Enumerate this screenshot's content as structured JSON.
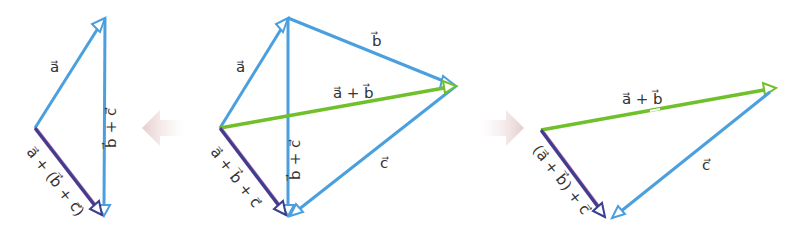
{
  "colors": {
    "vector_blue": "#4a9fdf",
    "vector_green": "#6fc02a",
    "resultant_dark": "#3a3f8f",
    "resultant_edge": "#d07ab8",
    "label": "#333333",
    "fade_arrow": "#e8d6d6"
  },
  "panels": [
    {
      "id": "left",
      "description": "a + (b + c)",
      "labels": {
        "a": "a⃗",
        "b_plus_c": "b⃗ + c⃗",
        "resultant": "a⃗ + (b⃗ + c⃗)"
      }
    },
    {
      "id": "middle",
      "description": "combined construction",
      "labels": {
        "a": "a⃗",
        "b": "b⃗",
        "c": "c⃗",
        "a_plus_b": "a⃗ + b⃗",
        "b_plus_c": "b⃗ + c⃗",
        "resultant": "a⃗ + b⃗ + c⃗"
      }
    },
    {
      "id": "right",
      "description": "(a + b) + c",
      "labels": {
        "a_plus_b": "a⃗ + b⃗",
        "c": "c⃗",
        "resultant": "(a⃗ + b⃗) + c⃗"
      }
    }
  ],
  "transition_arrows": [
    {
      "direction": "left",
      "icon": "fade-arrow-left"
    },
    {
      "direction": "right",
      "icon": "fade-arrow-right"
    }
  ]
}
